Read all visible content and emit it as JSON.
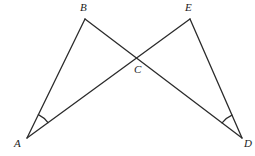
{
  "diagram": {
    "kind": "geometry-figure",
    "stroke_color": "#2b2b2b",
    "background_color": "#ffffff",
    "stroke_width": 1.3,
    "points": {
      "A": {
        "label": "A",
        "x": 27,
        "y": 138,
        "label_x": 14,
        "label_y": 139
      },
      "B": {
        "label": "B",
        "x": 85,
        "y": 19,
        "label_x": 80,
        "label_y": 3
      },
      "C": {
        "label": "C",
        "x": 137,
        "y": 61,
        "label_x": 134,
        "label_y": 65
      },
      "D": {
        "label": "D",
        "x": 242,
        "y": 138,
        "label_x": 244,
        "label_y": 139
      },
      "E": {
        "label": "E",
        "x": 190,
        "y": 19,
        "label_x": 185,
        "label_y": 3
      }
    },
    "segments": [
      {
        "name": "segment-AB",
        "from": "A",
        "to": "B"
      },
      {
        "name": "segment-BD",
        "from": "B",
        "to": "D"
      },
      {
        "name": "segment-AE",
        "from": "A",
        "to": "E"
      },
      {
        "name": "segment-ED",
        "from": "E",
        "to": "D"
      }
    ],
    "angle_marks": [
      {
        "name": "angle-mark-A",
        "vertex": "A",
        "arcs": 1
      },
      {
        "name": "angle-mark-D",
        "vertex": "D",
        "arcs": 1
      }
    ],
    "labels": [
      "A",
      "B",
      "C",
      "D",
      "E"
    ]
  }
}
